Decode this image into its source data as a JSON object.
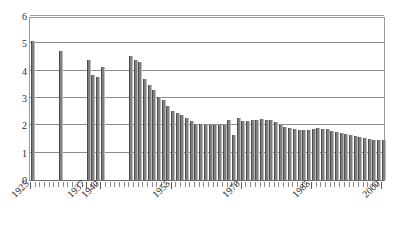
{
  "chart_data": {
    "type": "bar",
    "title": "",
    "subtitle": "",
    "xlabel": "",
    "ylabel": "",
    "xlim": [
      1925,
      2001
    ],
    "ylim": [
      0,
      6
    ],
    "y_ticks": [
      "0",
      "1",
      "2",
      "3",
      "4",
      "5",
      "6"
    ],
    "y_tick_values": [
      0,
      1,
      2,
      3,
      4,
      5,
      6
    ],
    "x_tick_labels": [
      "1925",
      "1937",
      "1940",
      "1955",
      "1970",
      "1985",
      "2000"
    ],
    "x_tick_values": [
      1925,
      1937,
      1940,
      1955,
      1970,
      1985,
      2000
    ],
    "grid": "horizontal",
    "legend": "none",
    "bar_color": "#808080",
    "bar_edge_color": "#4d4d4d",
    "gridline_color": "#8c8c8c",
    "axis_color": "#6e6e6e",
    "background": "#ffffff",
    "categories": [
      1925,
      1926,
      1927,
      1928,
      1929,
      1930,
      1931,
      1932,
      1933,
      1934,
      1935,
      1936,
      1937,
      1938,
      1939,
      1940,
      1941,
      1942,
      1943,
      1944,
      1945,
      1946,
      1947,
      1948,
      1949,
      1950,
      1951,
      1952,
      1953,
      1954,
      1955,
      1956,
      1957,
      1958,
      1959,
      1960,
      1961,
      1962,
      1963,
      1964,
      1965,
      1966,
      1967,
      1968,
      1969,
      1970,
      1971,
      1972,
      1973,
      1974,
      1975,
      1976,
      1977,
      1978,
      1979,
      1980,
      1981,
      1982,
      1983,
      1984,
      1985,
      1986,
      1987,
      1988,
      1989,
      1990,
      1991,
      1992,
      1993,
      1994,
      1995,
      1996,
      1997,
      1998,
      1999,
      2000
    ],
    "values": [
      5.1,
      null,
      null,
      null,
      null,
      null,
      4.72,
      null,
      null,
      null,
      null,
      null,
      4.38,
      3.83,
      3.78,
      4.12,
      null,
      null,
      null,
      null,
      null,
      4.55,
      4.4,
      4.33,
      3.68,
      3.47,
      3.3,
      3.03,
      2.93,
      2.7,
      2.53,
      2.45,
      2.38,
      2.28,
      2.17,
      2.05,
      2.05,
      2.02,
      2.0,
      2.0,
      2.01,
      2.02,
      2.18,
      1.63,
      2.26,
      2.16,
      2.15,
      2.2,
      2.2,
      2.22,
      2.2,
      2.18,
      2.11,
      2.0,
      1.95,
      1.92,
      1.86,
      1.82,
      1.84,
      1.82,
      1.85,
      1.9,
      1.88,
      1.86,
      1.81,
      1.75,
      1.72,
      1.7,
      1.65,
      1.62,
      1.57,
      1.52,
      1.51,
      1.48,
      1.47,
      1.47
    ]
  }
}
